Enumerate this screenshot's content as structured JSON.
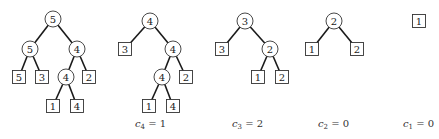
{
  "trees": [
    {
      "id": "tree-1",
      "caption": null,
      "nodes": [
        {
          "id": "a",
          "type": "circle",
          "label": "5",
          "x": 53,
          "y": 19
        },
        {
          "id": "b",
          "type": "circle",
          "label": "5",
          "x": 30,
          "y": 49
        },
        {
          "id": "c",
          "type": "circle",
          "label": "4",
          "x": 77,
          "y": 49
        },
        {
          "id": "d",
          "type": "square",
          "label": "5",
          "x": 19,
          "y": 77
        },
        {
          "id": "e",
          "type": "square",
          "label": "3",
          "x": 42,
          "y": 77
        },
        {
          "id": "f",
          "type": "circle",
          "label": "4",
          "x": 66,
          "y": 77
        },
        {
          "id": "g",
          "type": "square",
          "label": "2",
          "x": 89,
          "y": 77
        },
        {
          "id": "h",
          "type": "square",
          "label": "1",
          "x": 53,
          "y": 106
        },
        {
          "id": "i",
          "type": "square",
          "label": "4",
          "x": 77,
          "y": 106
        }
      ],
      "edges": [
        [
          "a",
          "b"
        ],
        [
          "a",
          "c"
        ],
        [
          "b",
          "d"
        ],
        [
          "b",
          "e"
        ],
        [
          "c",
          "f"
        ],
        [
          "c",
          "g"
        ],
        [
          "f",
          "h"
        ],
        [
          "f",
          "i"
        ]
      ]
    },
    {
      "id": "tree-2",
      "caption": {
        "var": "c",
        "sub": "4",
        "value": "1",
        "x": 135,
        "y": 125
      },
      "nodes": [
        {
          "id": "a",
          "type": "circle",
          "label": "4",
          "x": 150,
          "y": 21
        },
        {
          "id": "b",
          "type": "square",
          "label": "3",
          "x": 125,
          "y": 49
        },
        {
          "id": "c",
          "type": "circle",
          "label": "4",
          "x": 173,
          "y": 49
        },
        {
          "id": "d",
          "type": "circle",
          "label": "4",
          "x": 162,
          "y": 77
        },
        {
          "id": "e",
          "type": "square",
          "label": "2",
          "x": 186,
          "y": 77
        },
        {
          "id": "f",
          "type": "square",
          "label": "1",
          "x": 149,
          "y": 106
        },
        {
          "id": "g",
          "type": "square",
          "label": "4",
          "x": 173,
          "y": 106
        }
      ],
      "edges": [
        [
          "a",
          "b"
        ],
        [
          "a",
          "c"
        ],
        [
          "c",
          "d"
        ],
        [
          "c",
          "e"
        ],
        [
          "d",
          "f"
        ],
        [
          "d",
          "g"
        ]
      ]
    },
    {
      "id": "tree-3",
      "caption": {
        "var": "c",
        "sub": "3",
        "value": "2",
        "x": 232,
        "y": 125
      },
      "nodes": [
        {
          "id": "a",
          "type": "circle",
          "label": "3",
          "x": 245,
          "y": 21
        },
        {
          "id": "b",
          "type": "square",
          "label": "3",
          "x": 222,
          "y": 49
        },
        {
          "id": "c",
          "type": "circle",
          "label": "2",
          "x": 270,
          "y": 49
        },
        {
          "id": "d",
          "type": "square",
          "label": "1",
          "x": 258,
          "y": 77
        },
        {
          "id": "e",
          "type": "square",
          "label": "2",
          "x": 282,
          "y": 77
        }
      ],
      "edges": [
        [
          "a",
          "b"
        ],
        [
          "a",
          "c"
        ],
        [
          "c",
          "d"
        ],
        [
          "c",
          "e"
        ]
      ]
    },
    {
      "id": "tree-4",
      "caption": {
        "var": "c",
        "sub": "2",
        "value": "0",
        "x": 318,
        "y": 125
      },
      "nodes": [
        {
          "id": "a",
          "type": "circle",
          "label": "2",
          "x": 334,
          "y": 21
        },
        {
          "id": "b",
          "type": "square",
          "label": "1",
          "x": 312,
          "y": 49
        },
        {
          "id": "c",
          "type": "square",
          "label": "2",
          "x": 357,
          "y": 49
        }
      ],
      "edges": [
        [
          "a",
          "b"
        ],
        [
          "a",
          "c"
        ]
      ]
    },
    {
      "id": "tree-5",
      "caption": {
        "var": "c",
        "sub": "1",
        "value": "0",
        "x": 403,
        "y": 125
      },
      "nodes": [
        {
          "id": "a",
          "type": "square",
          "label": "1",
          "x": 419,
          "y": 21
        }
      ],
      "edges": []
    }
  ],
  "style": {
    "circle_radius": 8,
    "square_size": 13,
    "stroke_color": "#333333",
    "edge_color": "#1a1a1a"
  }
}
